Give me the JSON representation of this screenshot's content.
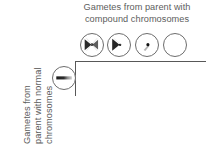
{
  "figure": {
    "type": "punnett-square-diagram",
    "background_color": "#ffffff",
    "line_color": "#585858",
    "text_color": "#5d5d5d"
  },
  "column_header": {
    "line1": "Gametes from parent with",
    "line2": "compound chromosomes"
  },
  "row_header": {
    "line1": "Gametes from",
    "line2": "parent with normal",
    "line3": "chromosomes"
  },
  "column_gametes": [
    {
      "id": "compound-both",
      "label": "compound-chromosome-gamete-both",
      "glyph": "double-wedge-with-dot",
      "contents": "attached-X pair plus small body"
    },
    {
      "id": "compound-single",
      "label": "compound-chromosome-gamete-single",
      "glyph": "single-wedge",
      "contents": "attached-X compound chromosome"
    },
    {
      "id": "compound-minor",
      "label": "compound-chromosome-gamete-minor",
      "glyph": "small-dot-with-streak",
      "contents": "small chromosome body only"
    },
    {
      "id": "compound-nullo",
      "label": "compound-chromosome-gamete-empty",
      "glyph": "empty",
      "contents": "no chromosomes"
    }
  ],
  "row_gametes": [
    {
      "id": "normal",
      "label": "normal-chromosome-gamete",
      "glyph": "horizontal-bar-gradient",
      "contents": "one normal chromosome"
    }
  ],
  "grid": {
    "horizontal_rule": true,
    "vertical_rule": true,
    "cells_filled": false
  }
}
